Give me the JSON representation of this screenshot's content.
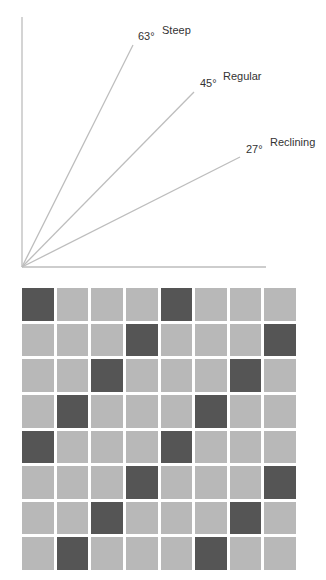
{
  "diagram": {
    "angles": [
      {
        "name": "Steep",
        "degrees_label": "63°",
        "degrees": 63
      },
      {
        "name": "Regular",
        "degrees_label": "45°",
        "degrees": 45
      },
      {
        "name": "Reclining",
        "degrees_label": "27°",
        "degrees": 27
      }
    ],
    "colors": {
      "axis": "#bdbdbd",
      "ray": "#bdbdbd",
      "text": "#333333",
      "tile_light": "#b8b8b8",
      "tile_dark": "#555555"
    }
  },
  "grid": {
    "rows": 8,
    "cols": 8,
    "dark_cells": [
      [
        0,
        0
      ],
      [
        0,
        4
      ],
      [
        1,
        3
      ],
      [
        1,
        7
      ],
      [
        2,
        2
      ],
      [
        2,
        6
      ],
      [
        3,
        1
      ],
      [
        3,
        5
      ],
      [
        4,
        0
      ],
      [
        4,
        4
      ],
      [
        5,
        3
      ],
      [
        5,
        7
      ],
      [
        6,
        2
      ],
      [
        6,
        6
      ],
      [
        7,
        1
      ],
      [
        7,
        5
      ]
    ]
  }
}
